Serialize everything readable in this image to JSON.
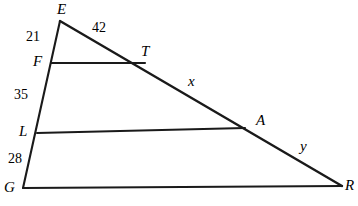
{
  "figure": {
    "type": "geometry-diagram",
    "shape": "triangle-with-parallel-transversals",
    "stroke_color": "#1a1a1a",
    "background_color": "#ffffff",
    "vertices": [
      {
        "name": "E",
        "label": "E",
        "x": 60,
        "y": 21,
        "label_x": 57,
        "label_y": 2
      },
      {
        "name": "F",
        "label": "F",
        "x": 51,
        "y": 63,
        "label_x": 33,
        "label_y": 54
      },
      {
        "name": "L",
        "label": "L",
        "x": 37,
        "y": 133,
        "label_x": 19,
        "label_y": 124
      },
      {
        "name": "G",
        "label": "G",
        "x": 23,
        "y": 188,
        "label_x": 4,
        "label_y": 180
      },
      {
        "name": "R",
        "label": "R",
        "x": 342,
        "y": 186,
        "label_x": 345,
        "label_y": 178
      },
      {
        "name": "A",
        "label": "A",
        "x": 245,
        "y": 128,
        "label_x": 256,
        "label_y": 113
      },
      {
        "name": "T",
        "label": "T",
        "x": 145,
        "y": 63,
        "label_x": 141,
        "label_y": 44
      }
    ],
    "segments": [
      {
        "name": "side-EG",
        "from": "E",
        "to": "G"
      },
      {
        "name": "side-ER",
        "from": "E",
        "to": "R"
      },
      {
        "name": "base-GR",
        "from": "G",
        "to": "R"
      },
      {
        "name": "transversal-FT",
        "from": "F",
        "to": "T"
      },
      {
        "name": "transversal-LA",
        "from": "L",
        "to": "A"
      }
    ],
    "measures": [
      {
        "name": "EF",
        "segment": "E-F",
        "value": "21",
        "x": 26,
        "y": 30
      },
      {
        "name": "FL",
        "segment": "F-L",
        "value": "35",
        "x": 14,
        "y": 88
      },
      {
        "name": "LG",
        "segment": "L-G",
        "value": "28",
        "x": 8,
        "y": 152
      },
      {
        "name": "ET",
        "segment": "E-T",
        "value": "42",
        "x": 92,
        "y": 21
      },
      {
        "name": "TA",
        "segment": "T-A",
        "value": "x",
        "x": 188,
        "y": 74
      },
      {
        "name": "AR",
        "segment": "A-R",
        "value": "y",
        "x": 300,
        "y": 139
      }
    ]
  }
}
